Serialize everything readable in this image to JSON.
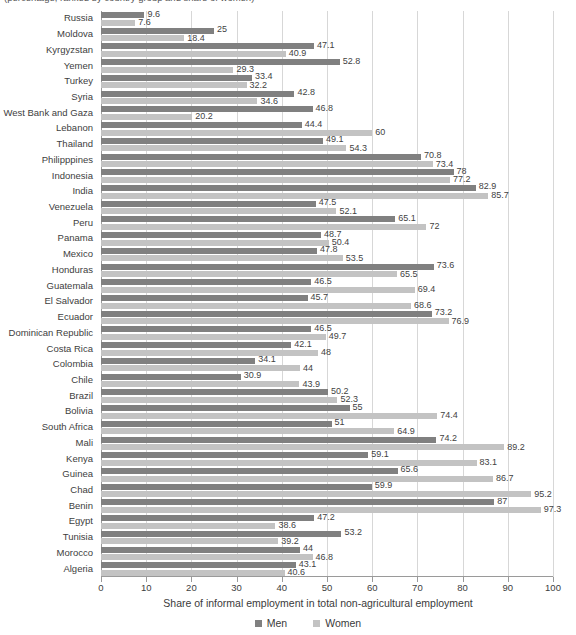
{
  "title_fragment": "(percentage, ranked by country group and share of women)",
  "legend": {
    "position": "bottom-center",
    "entries": [
      {
        "label": "Men",
        "color": "#808080"
      },
      {
        "label": "Women",
        "color": "#c3c3c3"
      }
    ]
  },
  "axis": {
    "xlabel": "Share of informal employment in total non-agricultural employment",
    "ticks": [
      0,
      10,
      20,
      30,
      40,
      50,
      60,
      70,
      80,
      90,
      100
    ]
  },
  "colors": {
    "men": "#808080",
    "women": "#c3c3c3",
    "grid": "#d7d7d7",
    "axis": "#9a9a9a",
    "text": "#3a3a3a"
  },
  "chart_data": {
    "type": "bar",
    "orientation": "horizontal",
    "title": "(percentage, ranked by country group and share of women)",
    "xlabel": "Share of informal employment in total non-agricultural employment",
    "ylabel": "",
    "xlim": [
      0,
      100
    ],
    "grid": true,
    "legend": [
      "Men",
      "Women"
    ],
    "categories": [
      "Russia",
      "Moldova",
      "Kyrgyzstan",
      "Yemen",
      "Turkey",
      "Syria",
      "West Bank and Gaza",
      "Lebanon",
      "Thailand",
      "Philipppines",
      "Indonesia",
      "India",
      "Venezuela",
      "Peru",
      "Panama",
      "Mexico",
      "Honduras",
      "Guatemala",
      "El Salvador",
      "Ecuador",
      "Dominican Republic",
      "Costa Rica",
      "Colombia",
      "Chile",
      "Brazil",
      "Bolivia",
      "South Africa",
      "Mali",
      "Kenya",
      "Guinea",
      "Chad",
      "Benin",
      "Egypt",
      "Tunisia",
      "Morocco",
      "Algeria"
    ],
    "series": [
      {
        "name": "Men",
        "color": "#808080",
        "values": [
          9.6,
          25,
          47.1,
          52.8,
          33.4,
          42.8,
          46.8,
          44.4,
          49.1,
          70.8,
          78,
          82.9,
          47.5,
          65.1,
          48.7,
          47.8,
          73.6,
          46.5,
          45.7,
          73.2,
          46.5,
          42.1,
          34.1,
          30.9,
          50.2,
          55,
          51,
          74.2,
          59.1,
          65.6,
          59.9,
          87,
          47.2,
          53.2,
          44,
          43.1
        ]
      },
      {
        "name": "Women",
        "color": "#c3c3c3",
        "values": [
          7.6,
          18.4,
          40.9,
          29.3,
          32.2,
          34.6,
          20.2,
          60,
          54.3,
          73.4,
          77.2,
          85.7,
          52.1,
          72,
          50.4,
          53.5,
          65.5,
          69.4,
          68.6,
          76.9,
          49.7,
          48,
          44,
          43.9,
          52.3,
          74.4,
          64.9,
          89.2,
          83.1,
          86.7,
          95.2,
          97.3,
          38.6,
          39.2,
          46.8,
          40.6
        ]
      }
    ]
  }
}
